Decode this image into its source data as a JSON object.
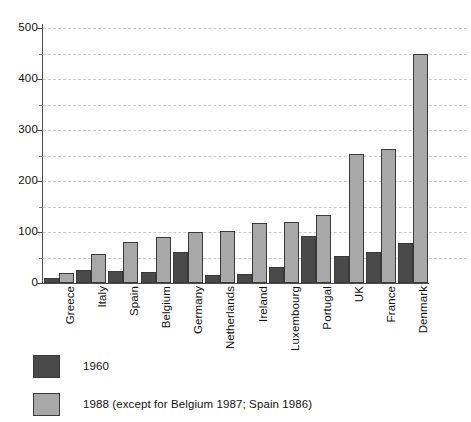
{
  "chart_data": {
    "type": "bar",
    "title": "",
    "subtitle": "",
    "xlabel": "",
    "ylabel": "",
    "ylim": [
      0,
      500
    ],
    "y_ticks": [
      0,
      100,
      200,
      300,
      400,
      500
    ],
    "y_minor_ticks": [
      50,
      150,
      250,
      350,
      450
    ],
    "grid": true,
    "grid_axis": "y",
    "grid_style": "dashed",
    "legend_position": "below-left",
    "categories": [
      "Greece",
      "Italy",
      "Spain",
      "Belgium",
      "Germany",
      "Netherlands",
      "Ireland",
      "Luxembourg",
      "Portugal",
      "UK",
      "France",
      "Denmark"
    ],
    "series": [
      {
        "name": "1960",
        "color": "#4a4a4a",
        "values": [
          10,
          25,
          24,
          22,
          60,
          15,
          17,
          31,
          93,
          52,
          60,
          78
        ]
      },
      {
        "name": "1988 (except for Belgium 1987; Spain 1986)",
        "color": "#a8a8a8",
        "values": [
          20,
          57,
          80,
          90,
          100,
          102,
          117,
          120,
          134,
          252,
          263,
          450
        ]
      }
    ]
  },
  "axis": {
    "y_tick_labels": [
      "0",
      "100",
      "200",
      "300",
      "400",
      "500"
    ],
    "axis_color": "#4c4c4c",
    "gridline_color": "#c9c9c9"
  },
  "legend": {
    "items": [
      {
        "label": "1960",
        "color": "#4a4a4a"
      },
      {
        "label": "1988 (except for Belgium 1987; Spain 1986)",
        "color": "#a8a8a8"
      }
    ]
  }
}
